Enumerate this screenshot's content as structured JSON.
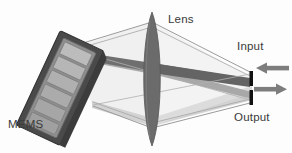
{
  "figure": {
    "kind": "optical-system-diagram",
    "width": 292,
    "height": 153,
    "background_color": "#fdfdfd"
  },
  "labels": {
    "mems_slm": "MEMS\nSLM",
    "mems_slm_line1": "MEMS",
    "mems_slm_line2": "SLM",
    "lens": "Lens",
    "input": "Input",
    "output": "Output",
    "text_color": "#3a3a3a"
  },
  "components": {
    "slm": {
      "name": "MEMS SLM",
      "body_color": "#4a4a4a",
      "face_color": "#8e8e8e",
      "segment_color": "#b4b4b4",
      "segment_count": 6,
      "tilt_degrees": 25
    },
    "lens": {
      "name": "Lens",
      "color": "#6b6b6b",
      "center_x": 152,
      "top_y": 12,
      "bottom_y": 146,
      "half_width": 11
    },
    "input_fiber": {
      "name": "input fiber end",
      "color": "#111111",
      "x": 251,
      "top_y": 71,
      "bottom_y": 86
    },
    "output_fiber": {
      "name": "output fiber end",
      "color": "#111111",
      "x": 251,
      "top_y": 90,
      "bottom_y": 105
    },
    "input_arrow": {
      "name": "input beam arrow",
      "direction": "left",
      "color": "#7d7d7d",
      "y": 68
    },
    "output_arrow": {
      "name": "output beam arrow",
      "direction": "right",
      "color": "#7d7d7d",
      "y": 89
    }
  },
  "beams": {
    "dark_beam_color": "#6a6a6a",
    "mid_beam_color": "#9a9a9a",
    "light_beam_color": "#d2d2d2",
    "outline_color": "#9b9b9b"
  }
}
